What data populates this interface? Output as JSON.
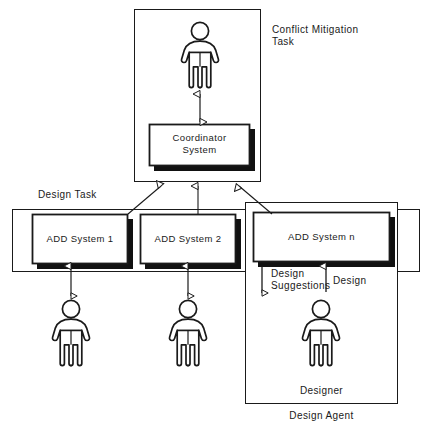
{
  "diagram": {
    "title_labels": {
      "conflict_mitigation_task": "Conflict Mitigation\nTask",
      "design_task": "Design Task",
      "design_agent": "Design Agent",
      "designer": "Designer"
    },
    "system_boxes": [
      {
        "id": "coordinator-system",
        "label": "Coordinator\nSystem",
        "x": 149,
        "y": 124,
        "w": 101,
        "h": 42
      },
      {
        "id": "add-system-1",
        "label": "ADD System 1",
        "x": 32,
        "y": 214,
        "w": 96,
        "h": 50
      },
      {
        "id": "add-system-2",
        "label": "ADD System 2",
        "x": 140,
        "y": 214,
        "w": 96,
        "h": 50
      },
      {
        "id": "add-system-n",
        "label": "ADD System n",
        "x": 253,
        "y": 212,
        "w": 137,
        "h": 50
      }
    ],
    "containers": [
      {
        "id": "conflict-mitigation-task-box",
        "x": 134,
        "y": 9,
        "w": 127,
        "h": 173
      },
      {
        "id": "design-task-box",
        "x": 12,
        "y": 209,
        "w": 408,
        "h": 63
      },
      {
        "id": "design-agent-box",
        "x": 245,
        "y": 202,
        "w": 153,
        "h": 202
      }
    ],
    "actors": [
      {
        "id": "conflict-mediator-person",
        "cx": 200,
        "cy": 22
      },
      {
        "id": "designer-person-1",
        "cx": 71,
        "cy": 300
      },
      {
        "id": "designer-person-2",
        "cx": 188,
        "cy": 300
      },
      {
        "id": "designer-person-n",
        "cx": 321,
        "cy": 300
      }
    ],
    "flow_labels": {
      "design_suggestions": "Design\nSuggestions",
      "design": "Design"
    },
    "colors": {
      "line": "#1a1a1a",
      "shadow": "#111111",
      "fill": "#ffffff",
      "text": "#1a1a1a"
    }
  }
}
